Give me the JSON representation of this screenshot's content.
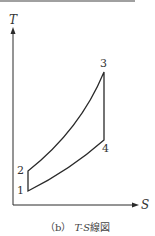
{
  "diagram": {
    "type": "T-S diagram (Brayton cycle)",
    "axes": {
      "y_label": "T",
      "x_label": "S"
    },
    "points": [
      {
        "id": "1",
        "label": "1"
      },
      {
        "id": "2",
        "label": "2"
      },
      {
        "id": "3",
        "label": "3"
      },
      {
        "id": "4",
        "label": "4"
      }
    ],
    "caption": {
      "prefix": "（b）",
      "title": "T-S",
      "suffix": "線図"
    }
  },
  "colors": {
    "line": "#2a2a2a",
    "top_rule": "#999999"
  }
}
